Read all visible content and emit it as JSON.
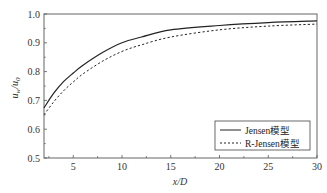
{
  "chart_data": {
    "type": "line",
    "title": "",
    "xlabel": "x/D",
    "ylabel": "u_w/u_0",
    "xlim": [
      2,
      30
    ],
    "ylim": [
      0.5,
      1.0
    ],
    "xticks": [
      5,
      10,
      15,
      20,
      25,
      30
    ],
    "yticks": [
      0.5,
      0.6,
      0.7,
      0.8,
      0.9,
      1.0
    ],
    "xtick_labels": [
      "5",
      "10",
      "15",
      "20",
      "25",
      "30"
    ],
    "ytick_labels": [
      "0.5",
      "0.6",
      "0.7",
      "0.8",
      "0.9",
      "1.0"
    ],
    "grid": false,
    "legend_position": "lower right",
    "x": [
      2,
      3,
      4,
      5,
      6,
      8,
      10,
      12,
      15,
      20,
      25,
      30
    ],
    "series": [
      {
        "name": "Jensen模型",
        "style": "solid",
        "color": "#222222",
        "values": [
          0.674,
          0.725,
          0.765,
          0.795,
          0.822,
          0.866,
          0.9,
          0.92,
          0.945,
          0.96,
          0.97,
          0.976
        ]
      },
      {
        "name": "R-Jensen模型",
        "style": "dashed",
        "color": "#222222",
        "values": [
          0.65,
          0.695,
          0.733,
          0.764,
          0.792,
          0.836,
          0.87,
          0.893,
          0.92,
          0.945,
          0.958,
          0.965
        ]
      }
    ]
  },
  "labels": {
    "xlabel": "x/D",
    "ylabel_main": "u",
    "ylabel_sub1": "w",
    "ylabel_sep": "/u",
    "ylabel_sub2": "0",
    "legend": [
      "Jensen模型",
      "R-Jensen模型"
    ]
  }
}
